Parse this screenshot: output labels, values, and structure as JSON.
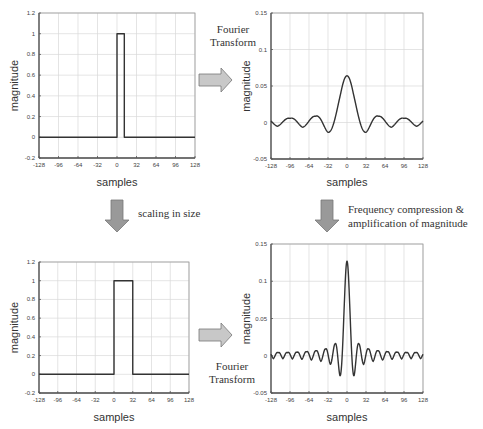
{
  "annotations": {
    "fourier_top": [
      "Fourier",
      "Transform"
    ],
    "fourier_bottom": [
      "Fourier",
      "Transform"
    ],
    "scaling": "scaling in size",
    "compression": [
      "Frequency compression &",
      "amplification of magnitude"
    ]
  },
  "colors": {
    "line": "#333333",
    "grid": "#d8d8d8",
    "frame": "#555555",
    "arrow_fill": "#c8c8c8",
    "arrow_stroke": "#777777"
  },
  "chart_data": [
    {
      "id": "top-left",
      "type": "line",
      "title": "",
      "xlabel": "samples",
      "ylabel": "magnitude",
      "xlim": [
        -128,
        128
      ],
      "ylim": [
        -0.2,
        1.2
      ],
      "xticks": [
        -128,
        -96,
        -64,
        -32,
        0,
        32,
        64,
        96,
        128
      ],
      "yticks": [
        -0.2,
        0,
        0.2,
        0.4,
        0.6,
        0.8,
        1,
        1.2
      ],
      "ytick_labels": [
        "-0.2",
        "0",
        "0.2",
        "0.4",
        "0.6",
        "0.8",
        "1",
        "1.2"
      ],
      "grid": true,
      "series": [
        {
          "name": "rect pulse",
          "kind": "rect",
          "start": 0,
          "width": 12,
          "height": 1
        }
      ]
    },
    {
      "id": "top-right",
      "type": "line",
      "title": "",
      "xlabel": "samples",
      "ylabel": "magnitude",
      "xlim": [
        -128,
        128
      ],
      "ylim": [
        -0.05,
        0.15
      ],
      "xticks": [
        -128,
        -96,
        -64,
        -32,
        0,
        32,
        64,
        96,
        128
      ],
      "yticks": [
        -0.05,
        0,
        0.05,
        0.1,
        0.15
      ],
      "ytick_labels": [
        "-0.05",
        "0",
        "0.05",
        "0.1",
        "0.15"
      ],
      "grid": true,
      "series": [
        {
          "name": "Fourier transform of pulse",
          "kind": "sinc",
          "peak": 0.062,
          "width": 12
        }
      ]
    },
    {
      "id": "bottom-left",
      "type": "line",
      "title": "",
      "xlabel": "samples",
      "ylabel": "magnitude",
      "xlim": [
        -128,
        128
      ],
      "ylim": [
        -0.2,
        1.2
      ],
      "xticks": [
        -128,
        -96,
        -64,
        -32,
        0,
        32,
        64,
        96,
        128
      ],
      "yticks": [
        -0.2,
        0,
        0.2,
        0.4,
        0.6,
        0.8,
        1,
        1.2
      ],
      "ytick_labels": [
        "-0.2",
        "0",
        "0.2",
        "0.4",
        "0.6",
        "0.8",
        "1",
        "1.2"
      ],
      "grid": true,
      "series": [
        {
          "name": "scaled rect pulse",
          "kind": "rect",
          "start": 0,
          "width": 32,
          "height": 1
        }
      ]
    },
    {
      "id": "bottom-right",
      "type": "line",
      "title": "",
      "xlabel": "samples",
      "ylabel": "magnitude",
      "xlim": [
        -128,
        128
      ],
      "ylim": [
        -0.05,
        0.15
      ],
      "xticks": [
        -128,
        -96,
        -64,
        -32,
        0,
        32,
        64,
        96,
        128
      ],
      "yticks": [
        -0.05,
        0,
        0.05,
        0.1,
        0.15
      ],
      "ytick_labels": [
        "-0.05",
        "0",
        "0.05",
        "0.1",
        "0.15"
      ],
      "grid": true,
      "series": [
        {
          "name": "Fourier transform of scaled pulse",
          "kind": "sinc",
          "peak": 0.125,
          "width": 32
        }
      ]
    }
  ]
}
